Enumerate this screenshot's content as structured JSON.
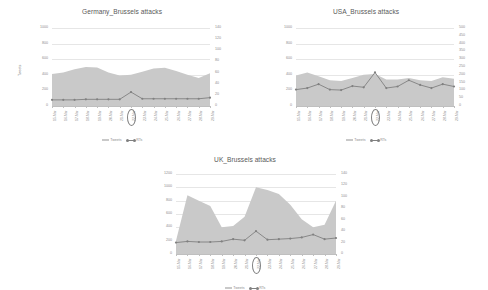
{
  "page": {
    "background": "#ffffff",
    "area_color": "#c9c9c9",
    "line_color": "#808080",
    "grid_color": "#e6e6e6",
    "text_color": "#8c8c8c"
  },
  "legend": {
    "tweets_label": "Tweets",
    "rts_label": "RTs"
  },
  "charts": [
    {
      "id": "germany",
      "title": "Germany_Brussels attacks",
      "ylabel": "Tweets",
      "highlight_index": 7
    },
    {
      "id": "usa",
      "title": "USA_Brussels attacks",
      "ylabel": "",
      "highlight_index": 7
    },
    {
      "id": "uk",
      "title": "UK_Brussels attacks",
      "ylabel": "",
      "highlight_index": 7
    }
  ],
  "chart_data": [
    {
      "id": "germany",
      "type": "area",
      "title": "Germany_Brussels attacks",
      "xlabel": "",
      "ylabel": "Tweets",
      "grid": true,
      "legend_position": "bottom",
      "categories": [
        "15-Mar",
        "16-Mar",
        "17-Mar",
        "18-Mar",
        "19-Mar",
        "20-Mar",
        "21-Mar",
        "22-Mar",
        "23-Mar",
        "24-Mar",
        "25-Mar",
        "26-Mar",
        "27-Mar",
        "28-Mar",
        "29-Mar"
      ],
      "left_axis": {
        "label": "Tweets",
        "ylim": [
          0,
          1000
        ],
        "ticks": [
          0,
          200,
          400,
          600,
          800,
          1000
        ]
      },
      "right_axis": {
        "label": "RTs",
        "ylim": [
          0,
          140
        ],
        "ticks": [
          0,
          20,
          40,
          60,
          80,
          100,
          120,
          140
        ]
      },
      "series": [
        {
          "name": "Tweets",
          "axis": "left",
          "kind": "area",
          "values": [
            410,
            430,
            470,
            500,
            495,
            430,
            390,
            400,
            440,
            480,
            490,
            450,
            400,
            360,
            420
          ]
        },
        {
          "name": "RTs",
          "axis": "right",
          "kind": "line",
          "values": [
            11,
            11,
            11,
            12,
            12,
            12,
            12,
            25,
            13,
            13,
            13,
            13,
            13,
            13,
            15
          ]
        }
      ],
      "highlight_category": "22-Mar"
    },
    {
      "id": "usa",
      "type": "area",
      "title": "USA_Brussels attacks",
      "xlabel": "",
      "ylabel": "",
      "grid": true,
      "legend_position": "bottom",
      "categories": [
        "15-Mar",
        "16-Mar",
        "17-Mar",
        "18-Mar",
        "19-Mar",
        "20-Mar",
        "21-Mar",
        "22-Mar",
        "23-Mar",
        "24-Mar",
        "25-Mar",
        "26-Mar",
        "27-Mar",
        "28-Mar",
        "29-Mar"
      ],
      "left_axis": {
        "label": "",
        "ylim": [
          0,
          1000
        ],
        "ticks": [
          0,
          200,
          400,
          600,
          800,
          1000
        ]
      },
      "right_axis": {
        "label": "",
        "ylim": [
          0,
          500
        ],
        "ticks": [
          0,
          50,
          100,
          150,
          200,
          250,
          300,
          350,
          400,
          450,
          500
        ]
      },
      "series": [
        {
          "name": "Tweets",
          "axis": "left",
          "kind": "area",
          "values": [
            390,
            430,
            380,
            330,
            320,
            360,
            400,
            410,
            340,
            340,
            360,
            330,
            320,
            370,
            350
          ]
        },
        {
          "name": "RTs",
          "axis": "right",
          "kind": "line",
          "values": [
            105,
            115,
            140,
            105,
            102,
            128,
            120,
            215,
            115,
            125,
            165,
            135,
            115,
            140,
            125
          ]
        }
      ],
      "highlight_category": "22-Mar"
    },
    {
      "id": "uk",
      "type": "area",
      "title": "UK_Brussels attacks",
      "xlabel": "",
      "ylabel": "",
      "grid": true,
      "legend_position": "bottom",
      "categories": [
        "15-Mar",
        "16-Mar",
        "17-Mar",
        "18-Mar",
        "19-Mar",
        "20-Mar",
        "21-Mar",
        "22-Mar",
        "23-Mar",
        "24-Mar",
        "25-Mar",
        "26-Mar",
        "27-Mar",
        "28-Mar",
        "29-Mar"
      ],
      "left_axis": {
        "label": "",
        "ylim": [
          0,
          1200
        ],
        "ticks": [
          0,
          200,
          400,
          600,
          800,
          1000,
          1200
        ]
      },
      "right_axis": {
        "label": "",
        "ylim": [
          0,
          140
        ],
        "ticks": [
          0,
          20,
          40,
          60,
          80,
          100,
          120,
          140
        ]
      },
      "series": [
        {
          "name": "Tweets",
          "axis": "left",
          "kind": "area",
          "values": [
            200,
            880,
            800,
            720,
            400,
            420,
            560,
            1000,
            960,
            900,
            740,
            520,
            400,
            440,
            800
          ]
        },
        {
          "name": "RTs",
          "axis": "right",
          "kind": "line",
          "values": [
            20,
            22,
            21,
            21,
            22,
            26,
            24,
            40,
            25,
            26,
            27,
            29,
            34,
            26,
            28
          ]
        }
      ],
      "highlight_category": "22-Mar"
    }
  ]
}
